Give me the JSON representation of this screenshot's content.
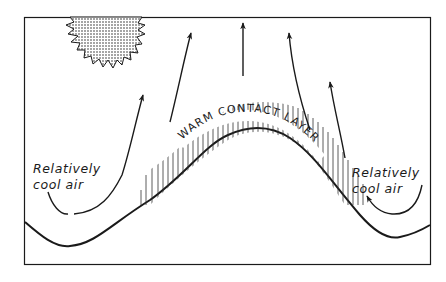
{
  "diagram": {
    "type": "schematic",
    "labels": {
      "left_cool_air_line1": "Relatively",
      "left_cool_air_line2": "cool air",
      "right_cool_air_line1": "Relatively",
      "right_cool_air_line2": "cool air",
      "warm_layer": "WARM CONTACT LAYER"
    },
    "elements": {
      "sun": "stippled sun with jagged rays, top-left",
      "hill": "bell-shaped ground profile",
      "warm_layer": "hatched band following hill crest",
      "arrows": [
        "left rising arrow from cool air",
        "upward-left arrow",
        "vertical arrow over crest",
        "upward-left arrow right of crest",
        "upward-left arrow far right",
        "curved arrow from right cool air toward hill"
      ]
    },
    "colors": {
      "ink": "#1a1a1a",
      "background": "#ffffff"
    }
  }
}
